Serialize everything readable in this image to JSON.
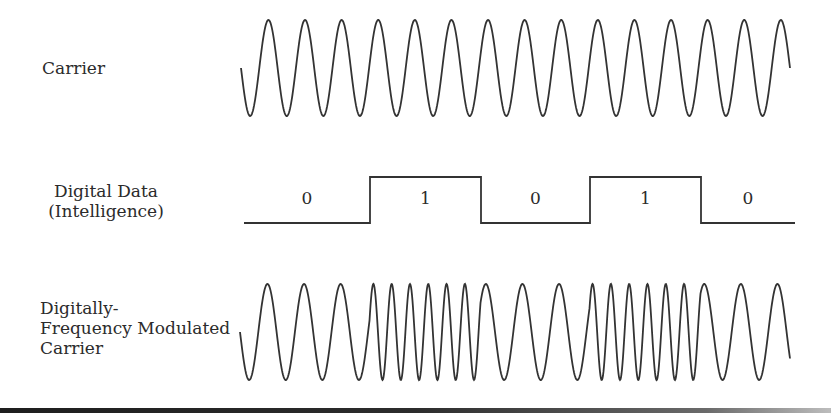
{
  "labels": {
    "carrier": "Carrier",
    "digital_line1": "Digital Data",
    "digital_line2": "(Intelligence)",
    "fm_line1": "Digitally-",
    "fm_line2": "Frequency Modulated",
    "fm_line3": "Carrier"
  },
  "digital_data": {
    "bits": [
      "0",
      "1",
      "0",
      "1",
      "0"
    ],
    "transitions_x": [
      244,
      370,
      481,
      590,
      701,
      795
    ],
    "high_y": 177,
    "low_y": 223
  },
  "carrier": {
    "x_start": 241,
    "x_end": 790,
    "mid_y": 68,
    "amplitude": 48,
    "period_px": 36.6,
    "cycles": 15
  },
  "fm_carrier": {
    "x_start": 240,
    "x_end": 790,
    "mid_y": 332,
    "amplitude": 48,
    "low_freq_period_px": 36.6,
    "high_freq_period_px": 18.3,
    "segments_follow_bits": true
  },
  "colors": {
    "stroke": "#333333",
    "text": "#2b2b2b",
    "background": "#ffffff"
  }
}
